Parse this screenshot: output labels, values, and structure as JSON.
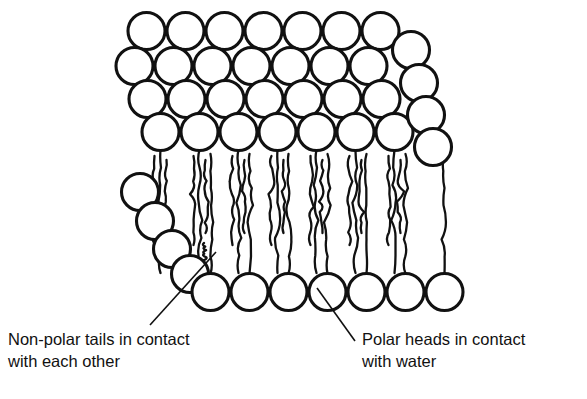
{
  "figure": {
    "background_color": "#ffffff",
    "line_color": "#111111",
    "head_fill_color": "#ffffff",
    "width": 587,
    "height": 399
  },
  "labels": {
    "left": {
      "line1": "Non-polar tails in contact",
      "line2": "with each other",
      "x": 8,
      "y1": 345,
      "y2": 367,
      "leader": {
        "x1": 150,
        "y1": 325,
        "x2": 216,
        "y2": 252
      }
    },
    "right": {
      "line1": "Polar heads in contact",
      "line2": "with water",
      "x": 362,
      "y1": 345,
      "y2": 367,
      "leader": {
        "x1": 355,
        "y1": 341,
        "x2": 317,
        "y2": 288
      }
    }
  },
  "geometry": {
    "head_radius": 18.5,
    "head_stroke_width": 3.1,
    "tail_stroke_width": 2.3,
    "top_rows": [
      {
        "name": "row-back-1",
        "count": 7,
        "x0": 146.5,
        "dx": 39.0,
        "cy": 31.0
      },
      {
        "name": "row-back-2",
        "count": 7,
        "x0": 134.5,
        "dx": 39.0,
        "cy": 66.0
      },
      {
        "name": "row-back-3",
        "count": 7,
        "x0": 147.5,
        "dx": 39.0,
        "cy": 99.0
      },
      {
        "name": "row-front",
        "count": 7,
        "x0": 160.5,
        "dx": 39.0,
        "cy": 132.0
      }
    ],
    "left_edge_heads": [
      {
        "cx": 140.0,
        "cy": 192.0
      },
      {
        "cx": 155.0,
        "cy": 221.0
      },
      {
        "cx": 172.0,
        "cy": 249.0
      },
      {
        "cx": 190.0,
        "cy": 274.0
      }
    ],
    "right_edge_heads": [
      {
        "cx": 411.0,
        "cy": 50.0
      },
      {
        "cx": 419.0,
        "cy": 83.0
      },
      {
        "cx": 426.0,
        "cy": 115.0
      },
      {
        "cx": 433.0,
        "cy": 147.0
      }
    ],
    "bottom_row": {
      "name": "row-bottom",
      "count": 7,
      "x0": 210.5,
      "dx": 39.0,
      "cy": 292.0
    },
    "tail_top_y": 150.0,
    "tail_bottom_y": 273.0
  },
  "chart_data": {
    "type": "diagram",
    "annotations": [
      "Non-polar tails in contact with each other",
      "Polar heads in contact with water"
    ],
    "counts": {
      "top_head_rows": 4,
      "heads_per_top_row": 7,
      "bottom_head_row_count": 7,
      "left_edge_heads": 4,
      "right_edge_heads": 4,
      "tail_pairs_visible": 7
    }
  }
}
